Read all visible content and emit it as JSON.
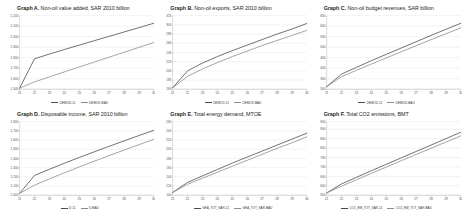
{
  "figure": {
    "background": "#ffffff",
    "series_colors": [
      "#4a4a4a",
      "#8c8c8c"
    ]
  },
  "panels": [
    {
      "id": "graph-a",
      "label": "Graph A.",
      "title": " Non-oil value added, SAR 2010 billion",
      "chart_data": {
        "type": "line",
        "title": "Graph A. Non-oil value added, SAR 2010 billion",
        "xlabel": "",
        "ylabel": "SAR 2010 billion",
        "x": [
          21,
          22,
          23,
          24,
          25,
          26,
          27,
          28,
          29,
          30
        ],
        "xticklabels": [
          "21",
          "22",
          "23",
          "24",
          "25",
          "26",
          "27",
          "28",
          "29",
          "30"
        ],
        "ylim": [
          1500,
          2200
        ],
        "yticks": [
          1500,
          1600,
          1700,
          1800,
          1900,
          2000,
          2100,
          2200
        ],
        "yticklabels": [
          "1,500",
          "1,600",
          "1,700",
          "1,800",
          "1,900",
          "2,000",
          "2,100",
          "2,200"
        ],
        "grid": true,
        "legend_position": "bottom",
        "series": [
          {
            "name": "DEMOD-11",
            "color": "#4a4a4a",
            "values": [
              1510,
              1790,
              1835,
              1878,
              1920,
              1962,
              2003,
              2045,
              2086,
              2128
            ]
          },
          {
            "name": "DEMOD-BAU",
            "color": "#8c8c8c",
            "values": [
              1510,
              1570,
              1618,
              1665,
              1712,
              1758,
              1805,
              1852,
              1898,
              1945
            ]
          }
        ]
      },
      "legend": [
        {
          "label": "DEMOD-11",
          "color": "#4a4a4a"
        },
        {
          "label": "DEMOD-BAU",
          "color": "#8c8c8c"
        }
      ]
    },
    {
      "id": "graph-b",
      "label": "Graph B.",
      "title": " Non-oil exports, SAR 2010 billion",
      "chart_data": {
        "type": "line",
        "title": "Graph B. Non-oil exports, SAR 2010 billion",
        "xlabel": "",
        "ylabel": "SAR 2010 billion",
        "x": [
          21,
          22,
          23,
          24,
          25,
          26,
          27,
          28,
          29,
          30
        ],
        "xticklabels": [
          "21",
          "22",
          "23",
          "24",
          "25",
          "26",
          "27",
          "28",
          "29",
          "30"
        ],
        "ylim": [
          165,
          325
        ],
        "yticks": [
          165,
          185,
          205,
          225,
          245,
          265,
          285,
          305,
          325
        ],
        "yticklabels": [
          "165",
          "185",
          "205",
          "225",
          "245",
          "265",
          "285",
          "305",
          "325"
        ],
        "grid": true,
        "legend_position": "bottom",
        "series": [
          {
            "name": "DEMOD-11",
            "color": "#4a4a4a",
            "values": [
              168,
              205,
              222,
              236,
              249,
              261,
              273,
              285,
              296,
              308
            ]
          },
          {
            "name": "DEMOD-BAU",
            "color": "#8c8c8c",
            "values": [
              168,
              193,
              209,
              223,
              236,
              248,
              260,
              271,
              282,
              293
            ]
          }
        ]
      },
      "legend": [
        {
          "label": "DEMOD-11",
          "color": "#4a4a4a"
        },
        {
          "label": "DEMOD-BAU",
          "color": "#8c8c8c"
        }
      ]
    },
    {
      "id": "graph-c",
      "label": "Graph C.",
      "title": " Non-oil budget revenues, SAR billion",
      "chart_data": {
        "type": "line",
        "title": "Graph C. Non-oil budget revenues, SAR billion",
        "xlabel": "",
        "ylabel": "SAR billion",
        "x": [
          21,
          22,
          23,
          24,
          25,
          26,
          27,
          28,
          29,
          30
        ],
        "xticklabels": [
          "21",
          "22",
          "23",
          "24",
          "25",
          "26",
          "27",
          "28",
          "29",
          "30"
        ],
        "ylim": [
          300,
          650
        ],
        "yticks": [
          300,
          350,
          400,
          450,
          500,
          550,
          600,
          650
        ],
        "yticklabels": [
          "300",
          "350",
          "400",
          "450",
          "500",
          "550",
          "600",
          "650"
        ],
        "grid": true,
        "legend_position": "bottom",
        "series": [
          {
            "name": "DEMOD-11",
            "color": "#4a4a4a",
            "values": [
              312,
              372,
              404,
              436,
              466,
              496,
              526,
              556,
              585,
              614
            ]
          },
          {
            "name": "DEMOD-BAU",
            "color": "#8c8c8c",
            "values": [
              312,
              360,
              390,
              420,
              449,
              478,
              507,
              536,
              564,
              592
            ]
          }
        ]
      },
      "legend": [
        {
          "label": "DEMOD-11",
          "color": "#4a4a4a"
        },
        {
          "label": "DEMOD-BAU",
          "color": "#8c8c8c"
        }
      ]
    },
    {
      "id": "graph-d",
      "label": "Graph D.",
      "title": " Disposable income, SAR 2010 billion",
      "chart_data": {
        "type": "line",
        "title": "Graph D. Disposable income, SAR 2010 billion",
        "xlabel": "",
        "ylabel": "SAR 2010 billion",
        "x": [
          21,
          22,
          23,
          24,
          25,
          26,
          27,
          28,
          29,
          30
        ],
        "xticklabels": [
          "21",
          "22",
          "23",
          "24",
          "25",
          "26",
          "27",
          "28",
          "29",
          "30"
        ],
        "ylim": [
          1000,
          1800
        ],
        "yticks": [
          1000,
          1100,
          1200,
          1300,
          1400,
          1500,
          1600,
          1700,
          1800
        ],
        "yticklabels": [
          "1,000",
          "1,100",
          "1,200",
          "1,300",
          "1,400",
          "1,500",
          "1,600",
          "1,700",
          "1,800"
        ],
        "grid": true,
        "legend_position": "bottom",
        "series": [
          {
            "name": "D-11",
            "color": "#4a4a4a",
            "values": [
              1020,
              1215,
              1283,
              1348,
              1411,
              1472,
              1532,
              1591,
              1649,
              1706
            ]
          },
          {
            "name": "D-BAU",
            "color": "#8c8c8c",
            "values": [
              1020,
              1110,
              1178,
              1244,
              1308,
              1370,
              1431,
              1491,
              1550,
              1608
            ]
          }
        ]
      },
      "legend": [
        {
          "label": "D-11",
          "color": "#4a4a4a"
        },
        {
          "label": "D-BAU",
          "color": "#8c8c8c"
        }
      ]
    },
    {
      "id": "graph-e",
      "label": "Graph E.",
      "title": " Total energy demand, MTOE",
      "chart_data": {
        "type": "line",
        "title": "Graph E. Total energy demand, MTOE",
        "xlabel": "",
        "ylabel": "MTOE",
        "x": [
          21,
          22,
          23,
          24,
          25,
          26,
          27,
          28,
          29,
          30
        ],
        "xticklabels": [
          "21",
          "22",
          "23",
          "24",
          "25",
          "26",
          "27",
          "28",
          "29",
          "30"
        ],
        "ylim": [
          100,
          260
        ],
        "yticks": [
          100,
          120,
          140,
          160,
          180,
          200,
          220,
          240,
          260
        ],
        "yticklabels": [
          "100",
          "120",
          "140",
          "160",
          "180",
          "200",
          "220",
          "240",
          "260"
        ],
        "grid": true,
        "legend_position": "bottom",
        "series": [
          {
            "name": "GEA_TOT_SAR-11",
            "color": "#4a4a4a",
            "values": [
              106,
              128,
              142,
              156,
              170,
              183,
              196,
              209,
              222,
              235
            ]
          },
          {
            "name": "GEA_TOT_SAR-BAU",
            "color": "#8c8c8c",
            "values": [
              106,
              124,
              137,
              150,
              163,
              176,
              189,
              202,
              214,
              227
            ]
          }
        ]
      },
      "legend": [
        {
          "label": "GEA_TOT_SAR-11",
          "color": "#4a4a4a"
        },
        {
          "label": "GEA_TOT_SAR-BAU",
          "color": "#8c8c8c"
        }
      ]
    },
    {
      "id": "graph-f",
      "label": "Graph F.",
      "title": " Total CO2 emissions, BMT",
      "chart_data": {
        "type": "line",
        "title": "Graph F. Total CO2 emissions, BMT",
        "xlabel": "",
        "ylabel": "BMT",
        "x": [
          21,
          22,
          23,
          24,
          25,
          26,
          27,
          28,
          29,
          30
        ],
        "xticklabels": [
          "21",
          "22",
          "23",
          "24",
          "25",
          "26",
          "27",
          "28",
          "29",
          "30"
        ],
        "ylim": [
          550,
          940
        ],
        "yticks": [
          550,
          600,
          650,
          700,
          750,
          800,
          850,
          900,
          940
        ],
        "yticklabels": [
          "550",
          "600",
          "650",
          "700",
          "750",
          "800",
          "850",
          "900",
          "940"
        ],
        "grid": true,
        "legend_position": "bottom",
        "series": [
          {
            "name": "CO2_EM_TOT_SAR-11",
            "color": "#4a4a4a",
            "values": [
              562,
              610,
              645,
              680,
              714,
              748,
              782,
              816,
              850,
              884
            ]
          },
          {
            "name": "CO2_EM_TOT_SAR-BAU",
            "color": "#8c8c8c",
            "values": [
              562,
              598,
              632,
              666,
              699,
              733,
              766,
              799,
              832,
              865
            ]
          }
        ]
      },
      "legend": [
        {
          "label": "CO2_EM_TOT_SAR-11",
          "color": "#4a4a4a"
        },
        {
          "label": "CO2_EM_TOT_SAR-BAU",
          "color": "#8c8c8c"
        }
      ]
    }
  ]
}
